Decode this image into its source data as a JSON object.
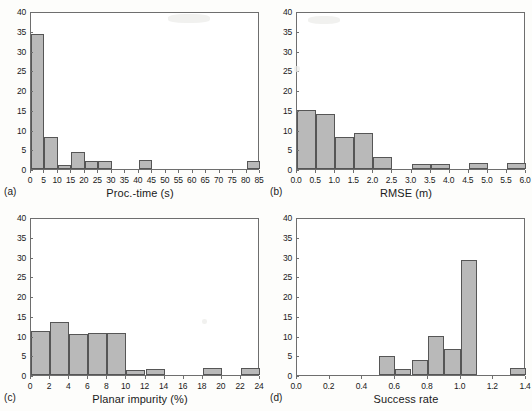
{
  "figure": {
    "caption_labels": [
      "(a)",
      "(b)",
      "(c)",
      "(d)"
    ],
    "bar_fill_color": "#b9b9b9",
    "bar_edge_color": "#565656",
    "axis_color": "#6e6e6e",
    "background_color": "#ffffff"
  },
  "chart_data": [
    {
      "type": "bar",
      "panel": "(a)",
      "title": "",
      "xlabel": "Proc.-time (s)",
      "ylabel": "",
      "xlim": [
        0,
        85
      ],
      "ylim": [
        0,
        40
      ],
      "grid": false,
      "legend": "none",
      "xticks": [
        "0",
        "5",
        "10",
        "15",
        "20",
        "25",
        "30",
        "35",
        "40",
        "45",
        "50",
        "55",
        "60",
        "65",
        "70",
        "75",
        "80",
        "85"
      ],
      "yticks": [
        "0",
        "5",
        "10",
        "15",
        "20",
        "25",
        "30",
        "35",
        "40"
      ],
      "bin_width": 5,
      "bins": [
        {
          "x0": 0,
          "x1": 5,
          "value": 34.3
        },
        {
          "x0": 5,
          "x1": 10,
          "value": 8.0
        },
        {
          "x0": 10,
          "x1": 15,
          "value": 1.0
        },
        {
          "x0": 15,
          "x1": 20,
          "value": 4.2
        },
        {
          "x0": 20,
          "x1": 25,
          "value": 2.1
        },
        {
          "x0": 25,
          "x1": 30,
          "value": 2.1
        },
        {
          "x0": 40,
          "x1": 45,
          "value": 2.3
        },
        {
          "x0": 80,
          "x1": 85,
          "value": 2.0
        }
      ]
    },
    {
      "type": "bar",
      "panel": "(b)",
      "title": "",
      "xlabel": "RMSE (m)",
      "ylabel": "",
      "xlim": [
        0.0,
        6.0
      ],
      "ylim": [
        0,
        40
      ],
      "grid": false,
      "legend": "none",
      "xticks": [
        "0.0",
        "0.5",
        "1.0",
        "1.5",
        "2.0",
        "2.5",
        "3.0",
        "3.5",
        "4.0",
        "4.5",
        "5.0",
        "5.5",
        "6.0"
      ],
      "yticks": [
        "0",
        "5",
        "10",
        "15",
        "20",
        "25",
        "30",
        "35",
        "40"
      ],
      "bin_width": 0.5,
      "bins": [
        {
          "x0": 0.0,
          "x1": 0.5,
          "value": 14.9
        },
        {
          "x0": 0.5,
          "x1": 1.0,
          "value": 14.0
        },
        {
          "x0": 1.0,
          "x1": 1.5,
          "value": 8.0
        },
        {
          "x0": 1.5,
          "x1": 2.0,
          "value": 9.0
        },
        {
          "x0": 2.0,
          "x1": 2.5,
          "value": 3.0
        },
        {
          "x0": 3.0,
          "x1": 3.5,
          "value": 1.3
        },
        {
          "x0": 3.5,
          "x1": 4.0,
          "value": 1.3
        },
        {
          "x0": 4.5,
          "x1": 5.0,
          "value": 1.6
        },
        {
          "x0": 5.5,
          "x1": 6.0,
          "value": 1.6
        }
      ]
    },
    {
      "type": "bar",
      "panel": "(c)",
      "title": "",
      "xlabel": "Planar impurity (%)",
      "ylabel": "",
      "xlim": [
        0,
        24
      ],
      "ylim": [
        0,
        40
      ],
      "grid": false,
      "legend": "none",
      "xticks": [
        "0",
        "2",
        "4",
        "6",
        "8",
        "10",
        "12",
        "14",
        "16",
        "18",
        "20",
        "22",
        "24"
      ],
      "yticks": [
        "0",
        "5",
        "10",
        "15",
        "20",
        "25",
        "30",
        "35",
        "40"
      ],
      "bin_width": 2,
      "bins": [
        {
          "x0": 0,
          "x1": 2,
          "value": 11.2
        },
        {
          "x0": 2,
          "x1": 4,
          "value": 13.5
        },
        {
          "x0": 4,
          "x1": 6,
          "value": 10.5
        },
        {
          "x0": 6,
          "x1": 8,
          "value": 10.6
        },
        {
          "x0": 8,
          "x1": 10,
          "value": 10.6
        },
        {
          "x0": 10,
          "x1": 12,
          "value": 1.3
        },
        {
          "x0": 12,
          "x1": 14,
          "value": 1.5
        },
        {
          "x0": 18,
          "x1": 20,
          "value": 1.8
        },
        {
          "x0": 22,
          "x1": 24,
          "value": 1.8
        }
      ]
    },
    {
      "type": "bar",
      "panel": "(d)",
      "title": "",
      "xlabel": "Success rate",
      "ylabel": "",
      "xlim": [
        0.0,
        1.4
      ],
      "ylim": [
        0,
        40
      ],
      "grid": false,
      "legend": "none",
      "xticks": [
        "0.0",
        "0.2",
        "0.4",
        "0.6",
        "0.8",
        "1.0",
        "1.2",
        "1.4"
      ],
      "yticks": [
        "0",
        "5",
        "10",
        "15",
        "20",
        "25",
        "30",
        "35",
        "40"
      ],
      "bin_width": 0.1,
      "bins": [
        {
          "x0": 0.5,
          "x1": 0.6,
          "value": 4.7
        },
        {
          "x0": 0.6,
          "x1": 0.7,
          "value": 1.4
        },
        {
          "x0": 0.7,
          "x1": 0.8,
          "value": 3.7
        },
        {
          "x0": 0.8,
          "x1": 0.9,
          "value": 9.8
        },
        {
          "x0": 0.9,
          "x1": 1.0,
          "value": 6.7
        },
        {
          "x0": 1.0,
          "x1": 1.1,
          "value": 29.1
        },
        {
          "x0": 1.3,
          "x1": 1.4,
          "value": 1.8
        }
      ]
    }
  ]
}
